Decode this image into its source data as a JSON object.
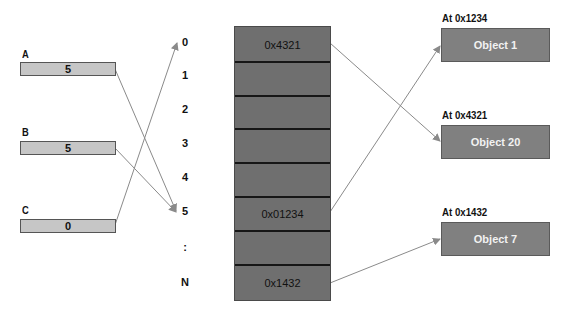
{
  "variables": [
    {
      "name": "A",
      "value": "5"
    },
    {
      "name": "B",
      "value": "5"
    },
    {
      "name": "C",
      "value": "0"
    }
  ],
  "indices": [
    "0",
    "1",
    "2",
    "3",
    "4",
    "5",
    ":",
    "N"
  ],
  "memory_cells": [
    "0x4321",
    "",
    "",
    "",
    "",
    "0x01234",
    "",
    "0x1432"
  ],
  "objects": [
    {
      "address_label": "At 0x1234",
      "name": "Object 1"
    },
    {
      "address_label": "At 0x4321",
      "name": "Object 20"
    },
    {
      "address_label": "At 0x1432",
      "name": "Object 7"
    }
  ],
  "arrows": [
    {
      "from": "A",
      "to": "index 5"
    },
    {
      "from": "B",
      "to": "index 5"
    },
    {
      "from": "C",
      "to": "index 0"
    },
    {
      "from": "cell 0x4321",
      "to": "Object 20"
    },
    {
      "from": "cell 0x01234",
      "to": "Object 1"
    },
    {
      "from": "cell 0x1432",
      "to": "Object 7"
    }
  ],
  "colors": {
    "variable_box": "#c6c6c6",
    "memory_block": "#6f6f6f",
    "object_box": "#808080",
    "arrow": "#8a8a8a"
  }
}
